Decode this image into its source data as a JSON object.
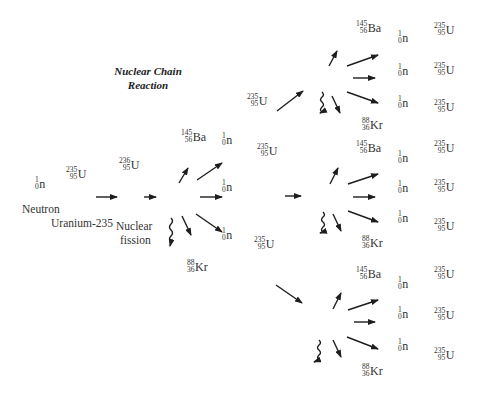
{
  "title": {
    "line1": "Nuclear Chain",
    "line2": "Reaction"
  },
  "initial": {
    "neutron": {
      "mass": "1",
      "atomic": "0",
      "symbol": "n",
      "label": "Neutron"
    },
    "uranium235": {
      "mass": "235",
      "atomic": "95",
      "symbol": "U",
      "label": "Uranium-235"
    },
    "uranium236": {
      "mass": "236",
      "atomic": "95",
      "symbol": "U"
    },
    "fission_label": {
      "line1": "Nuclear",
      "line2": "fission"
    }
  },
  "stage1": {
    "barium": {
      "mass": "145",
      "atomic": "56",
      "symbol": "Ba"
    },
    "krypton": {
      "mass": "88",
      "atomic": "36",
      "symbol": "Kr"
    },
    "neutrons": [
      {
        "mass": "1",
        "atomic": "0",
        "symbol": "n"
      },
      {
        "mass": "1",
        "atomic": "0",
        "symbol": "n"
      },
      {
        "mass": "1",
        "atomic": "0",
        "symbol": "n"
      }
    ],
    "uranium_targets": [
      {
        "mass": "235",
        "atomic": "95",
        "symbol": "U"
      },
      {
        "mass": "235",
        "atomic": "95",
        "symbol": "U"
      },
      {
        "mass": "235",
        "atomic": "95",
        "symbol": "U"
      }
    ]
  },
  "stage2": [
    {
      "barium": {
        "mass": "145",
        "atomic": "56",
        "symbol": "Ba"
      },
      "krypton": {
        "mass": "88",
        "atomic": "36",
        "symbol": "Kr"
      },
      "neutrons": [
        {
          "mass": "1",
          "atomic": "0",
          "symbol": "n"
        },
        {
          "mass": "1",
          "atomic": "0",
          "symbol": "n"
        },
        {
          "mass": "1",
          "atomic": "0",
          "symbol": "n"
        }
      ],
      "uranium_targets": [
        {
          "mass": "235",
          "atomic": "95",
          "symbol": "U"
        },
        {
          "mass": "235",
          "atomic": "95",
          "symbol": "U"
        },
        {
          "mass": "235",
          "atomic": "95",
          "symbol": "U"
        }
      ]
    },
    {
      "barium": {
        "mass": "145",
        "atomic": "56",
        "symbol": "Ba"
      },
      "krypton": {
        "mass": "88",
        "atomic": "36",
        "symbol": "Kr"
      },
      "neutrons": [
        {
          "mass": "1",
          "atomic": "0",
          "symbol": "n"
        },
        {
          "mass": "1",
          "atomic": "0",
          "symbol": "n"
        },
        {
          "mass": "1",
          "atomic": "0",
          "symbol": "n"
        }
      ],
      "uranium_targets": [
        {
          "mass": "235",
          "atomic": "95",
          "symbol": "U"
        },
        {
          "mass": "235",
          "atomic": "95",
          "symbol": "U"
        },
        {
          "mass": "235",
          "atomic": "95",
          "symbol": "U"
        }
      ]
    },
    {
      "barium": {
        "mass": "145",
        "atomic": "56",
        "symbol": "Ba"
      },
      "krypton": {
        "mass": "88",
        "atomic": "36",
        "symbol": "Kr"
      },
      "neutrons": [
        {
          "mass": "1",
          "atomic": "0",
          "symbol": "n"
        },
        {
          "mass": "1",
          "atomic": "0",
          "symbol": "n"
        },
        {
          "mass": "1",
          "atomic": "0",
          "symbol": "n"
        }
      ],
      "uranium_targets": [
        {
          "mass": "235",
          "atomic": "95",
          "symbol": "U"
        },
        {
          "mass": "235",
          "atomic": "95",
          "symbol": "U"
        },
        {
          "mass": "235",
          "atomic": "95",
          "symbol": "U"
        }
      ]
    }
  ],
  "colors": {
    "text": "#333333",
    "arrow": "#1e1e1e",
    "background": "#ffffff"
  }
}
